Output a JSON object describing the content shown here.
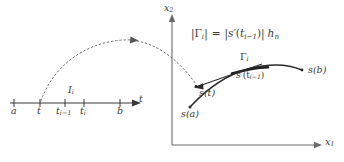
{
  "figure": {
    "kind": "math-diagram",
    "ink_color": "#3a3a3a",
    "background_color": "#ffffff"
  },
  "t_axis": {
    "label": "t",
    "ticks": [
      {
        "name": "a",
        "label": "a",
        "x": 14
      },
      {
        "name": "t",
        "label": "t",
        "x": 40
      },
      {
        "name": "t-i-minus-1",
        "label": "t",
        "sub": "i−1",
        "x": 65
      },
      {
        "name": "t-i",
        "label": "t",
        "sub": "i",
        "x": 84
      },
      {
        "name": "b",
        "label": "b",
        "x": 120
      }
    ],
    "interval_label": {
      "label": "I",
      "sub": "i"
    }
  },
  "plane": {
    "x_axis_label": {
      "label": "x",
      "sub": "1"
    },
    "y_axis_label": {
      "label": "x",
      "sub": "2"
    }
  },
  "curve_labels": {
    "gamma_i": {
      "label": "Γ",
      "sub": "i"
    },
    "s_a": "s(a)",
    "s_t": "s(t)",
    "s_b": "s(b)",
    "derivative": {
      "head": "s",
      "prime": "′",
      "arg": "(t",
      "arg_sub": "i−1",
      "arg_end": ")"
    }
  },
  "formula": {
    "text": "|Γi| = |s′(ti−1)| hn",
    "parts": {
      "lhs_bar": "|",
      "gamma": "Γ",
      "gamma_sub": "i",
      "equals": "=",
      "s": "s",
      "prime": "′",
      "open": "(",
      "t": "t",
      "t_sub": "i−1",
      "close": ")",
      "h": "h",
      "h_sub": "n"
    }
  }
}
